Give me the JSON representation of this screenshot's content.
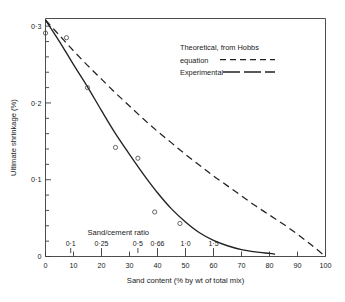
{
  "chart_data": {
    "type": "line",
    "title": "",
    "xlabel": "Sand content (% by wt of total mix)",
    "ylabel": "Ultimate shrinkage (%)",
    "xlim": [
      0,
      100
    ],
    "ylim": [
      0,
      0.31
    ],
    "grid": false,
    "legend_position": "upper-right",
    "x_ticks": [
      0,
      10,
      20,
      30,
      40,
      50,
      60,
      70,
      80,
      90,
      100
    ],
    "x_tick_labels": [
      "0",
      "10",
      "20",
      "30",
      "40",
      "50",
      "60",
      "70",
      "80",
      "90",
      "100"
    ],
    "y_ticks": [
      0,
      0.1,
      0.2,
      0.3
    ],
    "y_tick_labels": [
      "0",
      "0·1",
      "0·2",
      "0·3"
    ],
    "y_minor_step": 0.02,
    "secondary_axis": {
      "title": "Sand/cement ratio",
      "tick_labels": [
        "0·1",
        "0·25",
        "0·5",
        "0·66",
        "1·0",
        "1·5"
      ],
      "tick_positions": [
        9,
        20,
        33,
        40,
        50,
        60
      ]
    },
    "series": [
      {
        "name": "Theoretical, from Hobbs equation",
        "style": "dashed",
        "points": [
          [
            0,
            0.308
          ],
          [
            5,
            0.288
          ],
          [
            10,
            0.268
          ],
          [
            15,
            0.249
          ],
          [
            20,
            0.231
          ],
          [
            25,
            0.213
          ],
          [
            30,
            0.196
          ],
          [
            35,
            0.179
          ],
          [
            40,
            0.163
          ],
          [
            45,
            0.148
          ],
          [
            50,
            0.133
          ],
          [
            55,
            0.119
          ],
          [
            60,
            0.105
          ],
          [
            65,
            0.092
          ],
          [
            70,
            0.079
          ],
          [
            75,
            0.066
          ],
          [
            80,
            0.054
          ],
          [
            85,
            0.042
          ],
          [
            90,
            0.029
          ],
          [
            95,
            0.015
          ],
          [
            100,
            0.0
          ]
        ]
      },
      {
        "name": "Experimental",
        "style": "solid",
        "points": [
          [
            0,
            0.308
          ],
          [
            5,
            0.28
          ],
          [
            10,
            0.25
          ],
          [
            15,
            0.221
          ],
          [
            20,
            0.19
          ],
          [
            25,
            0.16
          ],
          [
            30,
            0.133
          ],
          [
            35,
            0.107
          ],
          [
            40,
            0.083
          ],
          [
            45,
            0.062
          ],
          [
            50,
            0.045
          ],
          [
            55,
            0.031
          ],
          [
            60,
            0.021
          ],
          [
            65,
            0.014
          ],
          [
            70,
            0.009
          ],
          [
            75,
            0.006
          ],
          [
            80,
            0.004
          ],
          [
            82,
            0.003
          ]
        ]
      }
    ],
    "data_points": [
      [
        0,
        0.291
      ],
      [
        7.5,
        0.285
      ],
      [
        15,
        0.22
      ],
      [
        25,
        0.142
      ],
      [
        33,
        0.128
      ],
      [
        39,
        0.058
      ],
      [
        48,
        0.043
      ]
    ],
    "legend": [
      {
        "label_line1": "Theoretical, from  Hobbs",
        "label_line2": "equation",
        "style": "dashed"
      },
      {
        "label_line1": "Experimental",
        "label_line2": "",
        "style": "solid"
      }
    ]
  },
  "figure": {
    "y_axis_title": "Ultimate shrinkage (%)",
    "x_axis_title": "Sand content (% by wt of total mix)",
    "secondary_axis_title": "Sand/cement ratio"
  }
}
